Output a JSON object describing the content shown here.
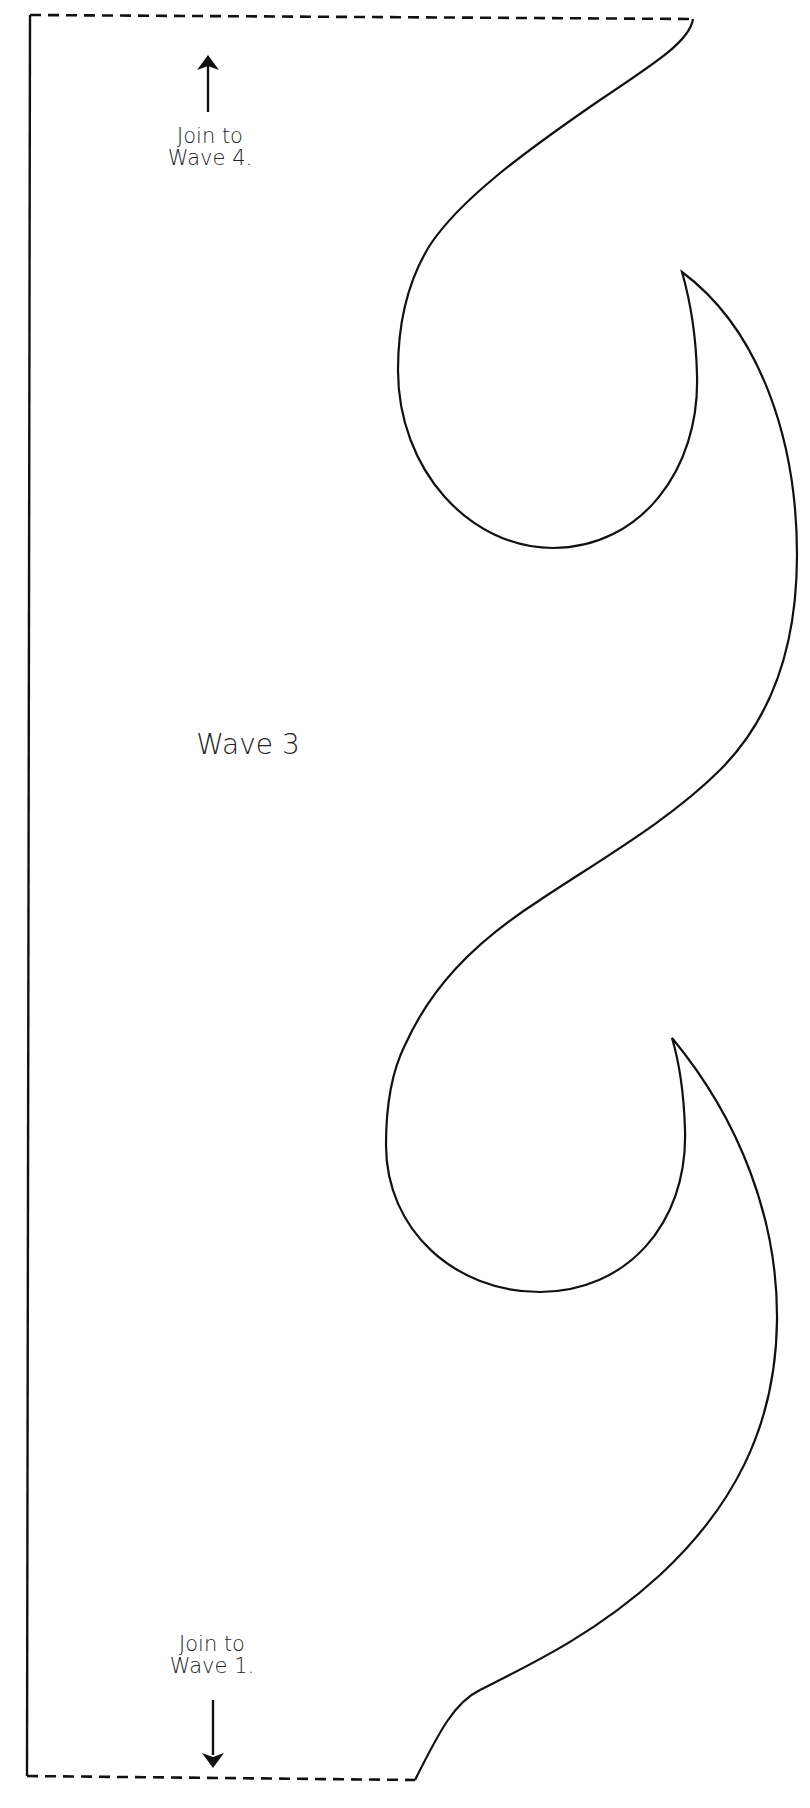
{
  "pattern": {
    "piece_name": "Wave 3",
    "top_note": {
      "line1": "Join to",
      "line2": "Wave 4.",
      "arrow": "arrow-up-icon"
    },
    "bottom_note": {
      "line1": "Join to",
      "line2": "Wave 1.",
      "arrow": "arrow-down-icon"
    },
    "colors": {
      "stroke": "#111111",
      "background": "#ffffff",
      "text": "#222222"
    }
  }
}
